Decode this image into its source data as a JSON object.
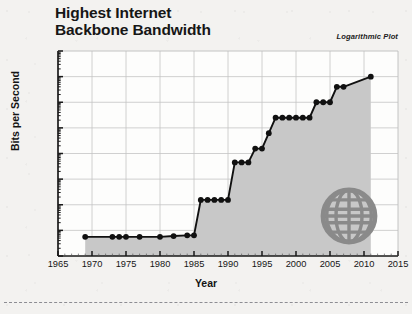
{
  "page": {
    "background_color": "#f3f2f0",
    "cut_line": "dashed-separator"
  },
  "header": {
    "title_line1": "Highest Internet",
    "title_line2": "Backbone Bandwidth",
    "annotation": "Logarithmic Plot"
  },
  "icons": {
    "globe": "globe-icon",
    "globe_color": "#8a8a8a"
  },
  "chart_data": {
    "type": "line",
    "title": "Highest Internet Backbone Bandwidth",
    "subtitle": "Logarithmic Plot",
    "xlabel": "Year",
    "ylabel": "Bits per Second",
    "yscale": "log",
    "ylim": [
      10000,
      1000000000000
    ],
    "xlim": [
      1965,
      2015
    ],
    "grid": true,
    "legend": "none",
    "filled_area": true,
    "fill_color": "#c8c8c8",
    "line_color": "#111111",
    "marker": "circle",
    "xtick_labels": [
      "1965",
      "1970",
      "1975",
      "1980",
      "1985",
      "1990",
      "1995",
      "2000",
      "2005",
      "2010",
      "2015"
    ],
    "xticks": [
      1965,
      1970,
      1975,
      1980,
      1985,
      1990,
      1995,
      2000,
      2005,
      2010,
      2015
    ],
    "ytick_labels": [
      "10¹²",
      "10¹¹",
      "10¹⁰",
      "10⁹",
      "10⁸",
      "10⁷",
      "10⁶",
      "10⁵",
      "10⁴"
    ],
    "ytick_exponents": [
      12,
      11,
      10,
      9,
      8,
      7,
      6,
      5,
      4
    ],
    "yticks": [
      1000000000000,
      100000000000,
      10000000000,
      1000000000,
      100000000,
      10000000,
      1000000,
      100000,
      10000
    ],
    "x": [
      1969,
      1973,
      1974,
      1975,
      1977,
      1980,
      1982,
      1984,
      1985,
      1986,
      1987,
      1988,
      1989,
      1990,
      1991,
      1992,
      1993,
      1994,
      1995,
      1996,
      1997,
      1998,
      1999,
      2000,
      2001,
      2002,
      2003,
      2004,
      2005,
      2006,
      2007,
      2011
    ],
    "values": [
      56000,
      56000,
      56000,
      56000,
      56000,
      56000,
      60000,
      64000,
      64000,
      1544000,
      1544000,
      1544000,
      1544000,
      1544000,
      45000000,
      45000000,
      45000000,
      155000000,
      155000000,
      622000000,
      2500000000,
      2500000000,
      2500000000,
      2500000000,
      2500000000,
      2500000000,
      10000000000,
      10000000000,
      10000000000,
      40000000000,
      40000000000,
      100000000000
    ],
    "annotations": []
  }
}
